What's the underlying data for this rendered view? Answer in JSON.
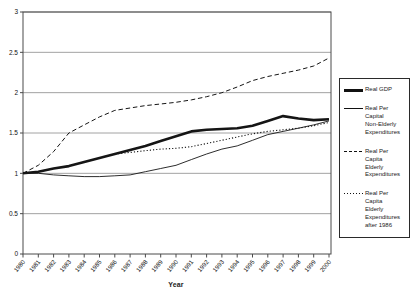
{
  "figure": {
    "background": "#ffffff",
    "line_color": "#151515",
    "grid_color": "#8a8a8a",
    "frame_color": "#4a4a4a"
  },
  "axes": {
    "xlabel": "Year",
    "ylim": [
      0,
      3
    ],
    "y_tick_values": [
      0,
      0.5,
      1,
      1.5,
      2,
      2.5,
      3
    ],
    "y_tick_labels": [
      "0",
      "0.5",
      "1",
      "1.5",
      "2",
      "2.5",
      "3"
    ],
    "x_tick_labels": [
      "1980",
      "1981",
      "1982",
      "1983",
      "1984",
      "1985",
      "1986",
      "1987",
      "1988",
      "1989",
      "1990",
      "1991",
      "1992",
      "1993",
      "1994",
      "1995",
      "1996",
      "1997",
      "1998",
      "1999",
      "2000"
    ]
  },
  "legend": {
    "items": [
      {
        "label": "Real GDP",
        "style": "thick-solid"
      },
      {
        "label": "Real Per Capital\nNon-Elderly\nExpenditures",
        "style": "thin-solid"
      },
      {
        "label": "Real Per Capita\nElderly\nExpenditures",
        "style": "dashed"
      },
      {
        "label": "Real Per Capita\nElderly\nExpenditures\nafter 1986",
        "style": "dotted"
      }
    ]
  },
  "chart_data": {
    "type": "line",
    "title": "",
    "xlabel": "Year",
    "ylabel": "",
    "ylim": [
      0,
      3
    ],
    "grid": true,
    "legend_position": "right",
    "x": [
      1980,
      1981,
      1982,
      1983,
      1984,
      1985,
      1986,
      1987,
      1988,
      1989,
      1990,
      1991,
      1992,
      1993,
      1994,
      1995,
      1996,
      1997,
      1998,
      1999,
      2000
    ],
    "series": [
      {
        "name": "Real Per Capita Elderly Expenditures",
        "style": "dashed",
        "values": [
          1.0,
          1.1,
          1.27,
          1.5,
          1.6,
          1.7,
          1.78,
          1.81,
          1.84,
          1.86,
          1.88,
          1.91,
          1.95,
          2.0,
          2.07,
          2.15,
          2.2,
          2.24,
          2.28,
          2.33,
          2.43
        ]
      },
      {
        "name": "Real Per Capital Non-Elderly Expenditures",
        "style": "thin-solid",
        "values": [
          1.0,
          1.0,
          0.98,
          0.97,
          0.96,
          0.96,
          0.97,
          0.98,
          1.02,
          1.06,
          1.1,
          1.17,
          1.24,
          1.3,
          1.34,
          1.41,
          1.48,
          1.52,
          1.56,
          1.6,
          1.65
        ]
      },
      {
        "name": "Real Per Capita Elderly Expenditures after 1986",
        "style": "dotted",
        "values": [
          null,
          null,
          null,
          null,
          null,
          null,
          1.24,
          1.26,
          1.28,
          1.3,
          1.31,
          1.33,
          1.37,
          1.41,
          1.45,
          1.49,
          1.52,
          1.54,
          1.56,
          1.59,
          1.63
        ]
      },
      {
        "name": "Real GDP",
        "style": "thick-solid",
        "values": [
          1.0,
          1.02,
          1.06,
          1.09,
          1.14,
          1.19,
          1.24,
          1.29,
          1.34,
          1.4,
          1.46,
          1.52,
          1.54,
          1.55,
          1.56,
          1.59,
          1.65,
          1.71,
          1.68,
          1.66,
          1.67
        ]
      }
    ]
  }
}
